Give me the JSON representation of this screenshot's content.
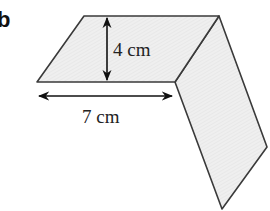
{
  "figure": {
    "part_label": "b",
    "height_label": "4 cm",
    "width_label": "7 cm",
    "colors": {
      "fill": "#ececec",
      "stroke": "#3a3a3a",
      "arrow": "#111111"
    },
    "shapes": {
      "top_face": "parallelogram",
      "side_face": "parallelogram"
    }
  }
}
